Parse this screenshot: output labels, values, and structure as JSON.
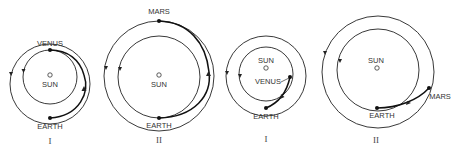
{
  "panels": [
    {
      "id": "panel-1",
      "numeral": "I",
      "labels": {
        "sun": "SUN",
        "inner_planet": "VENUS",
        "earth": "EARTH"
      },
      "description": "Earth to Venus transfer, planets at opposition"
    },
    {
      "id": "panel-2",
      "numeral": "II",
      "labels": {
        "sun": "SUN",
        "outer_planet": "MARS",
        "earth": "EARTH"
      },
      "description": "Earth to Mars transfer, Mars at opposition"
    },
    {
      "id": "panel-3",
      "numeral": "I",
      "labels": {
        "sun": "SUN",
        "inner_planet": "VENUS",
        "earth": "EARTH"
      },
      "description": "Earth to Venus short transfer"
    },
    {
      "id": "panel-4",
      "numeral": "II",
      "labels": {
        "sun": "SUN",
        "outer_planet": "MARS",
        "earth": "EARTH"
      },
      "description": "Earth to Mars short transfer"
    }
  ],
  "colors": {
    "line": "#222222",
    "background": "#ffffff"
  }
}
